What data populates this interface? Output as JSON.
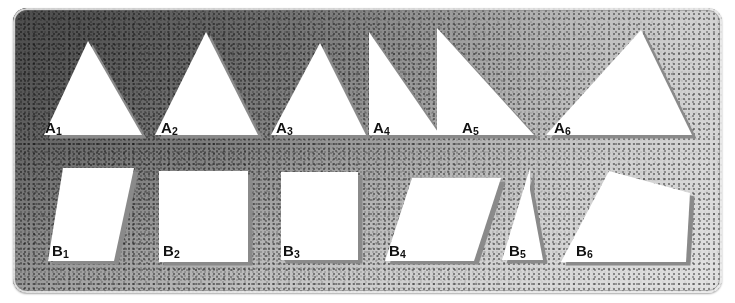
{
  "figure": {
    "background_dark": "#5d5d5d",
    "background_light": "#e2e2e2",
    "shape_fill": "#ffffff",
    "shape_shadow": "#8a8a8a",
    "label_color": "#121212"
  },
  "rows": [
    {
      "name": "row-a",
      "kind": "triangles",
      "baseline_y": 136,
      "shapes": [
        {
          "id": "A1",
          "letter": "A",
          "index": "1",
          "type": "isosceles-triangle",
          "label_x": 45,
          "label_y": 120,
          "points": "88,41 142,135 44,135"
        },
        {
          "id": "A2",
          "letter": "A",
          "index": "2",
          "type": "isosceles-triangle",
          "label_x": 161,
          "label_y": 120,
          "points": "206,32 258,135 155,135"
        },
        {
          "id": "A3",
          "letter": "A",
          "index": "3",
          "type": "isosceles-triangle",
          "label_x": 276,
          "label_y": 120,
          "points": "320,43 366,135 271,135"
        },
        {
          "id": "A4",
          "letter": "A",
          "index": "4",
          "type": "right-triangle",
          "label_x": 373,
          "label_y": 120,
          "points": "369,32 369,135 440,135"
        },
        {
          "id": "A5",
          "letter": "A",
          "index": "5",
          "type": "right-triangle",
          "label_x": 462,
          "label_y": 120,
          "points": "437,28 437,135 534,135"
        },
        {
          "id": "A6",
          "letter": "A",
          "index": "6",
          "type": "triangle",
          "label_x": 554,
          "label_y": 120,
          "points": "641,30 692,135 546,135"
        }
      ]
    },
    {
      "name": "row-b",
      "kind": "quadrilaterals",
      "baseline_y": 261,
      "shapes": [
        {
          "id": "B1",
          "letter": "B",
          "index": "1",
          "type": "parallelogram",
          "label_x": 52,
          "label_y": 243,
          "points": "63,168 134,168 114,261 48,261"
        },
        {
          "id": "B2",
          "letter": "B",
          "index": "2",
          "type": "square",
          "label_x": 163,
          "label_y": 243,
          "points": "159,171 248,171 248,262 159,262"
        },
        {
          "id": "B3",
          "letter": "B",
          "index": "3",
          "type": "square",
          "label_x": 283,
          "label_y": 243,
          "points": "281,172 358,172 358,260 281,260"
        },
        {
          "id": "B4",
          "letter": "B",
          "index": "4",
          "type": "parallelogram",
          "label_x": 389,
          "label_y": 243,
          "points": "412,178 501,178 474,261 385,261"
        },
        {
          "id": "B5",
          "letter": "B",
          "index": "5",
          "type": "trapezoid",
          "label_x": 509,
          "label_y": 243,
          "points": "530,168 530,190 543,260 502,260"
        },
        {
          "id": "B6",
          "letter": "B",
          "index": "6",
          "type": "quadrilateral",
          "label_x": 576,
          "label_y": 243,
          "points": "609,171 690,193 686,262 561,262"
        }
      ]
    }
  ]
}
